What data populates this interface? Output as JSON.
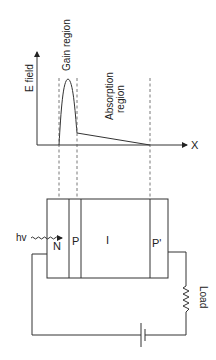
{
  "diagram": {
    "graph": {
      "y_axis_label": "E field",
      "x_axis_label": "X",
      "gain_region_label": "Gain region",
      "absorption_region_label_line1": "Absorption",
      "absorption_region_label_line2": "region"
    },
    "device": {
      "layers": [
        "N",
        "P",
        "I",
        "P'"
      ],
      "photon_label": "hv"
    },
    "circuit": {
      "load_label": "Load"
    }
  }
}
